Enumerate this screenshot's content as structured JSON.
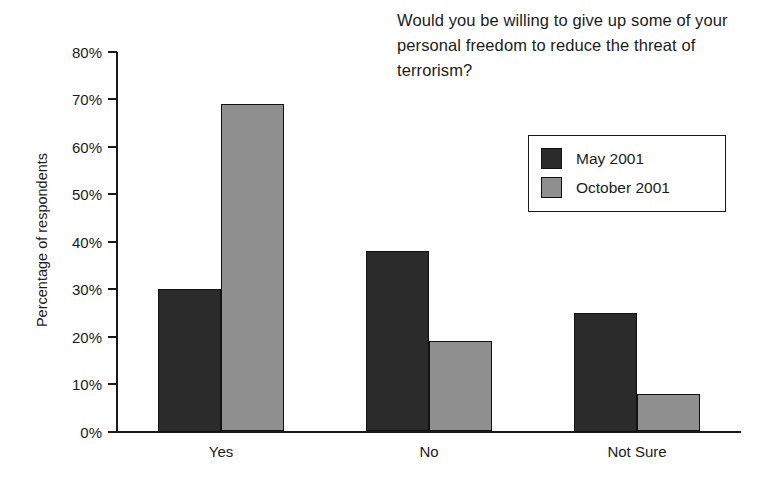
{
  "chart_data": {
    "type": "bar",
    "title": "Would you be willing to give up some of your personal freedom to reduce the threat of terrorism?",
    "xlabel": "",
    "ylabel": "Percentage of respondents",
    "categories": [
      "Yes",
      "No",
      "Not Sure"
    ],
    "series": [
      {
        "name": "May 2001",
        "color": "#2b2b2b",
        "values": [
          30,
          38,
          25
        ]
      },
      {
        "name": "October 2001",
        "color": "#8f8f8f",
        "values": [
          69,
          19,
          8
        ]
      }
    ],
    "ylim": [
      0,
      80
    ],
    "ytick_labels": [
      "80%",
      "70%",
      "60%",
      "50%",
      "40%",
      "30%",
      "20%",
      "10%",
      "0%"
    ],
    "ytick_values": [
      80,
      70,
      60,
      50,
      40,
      30,
      20,
      10,
      0
    ],
    "grid": false,
    "legend_position": "top-right"
  },
  "legend": {
    "entries": [
      {
        "label": "May 2001"
      },
      {
        "label": "October 2001"
      }
    ]
  }
}
